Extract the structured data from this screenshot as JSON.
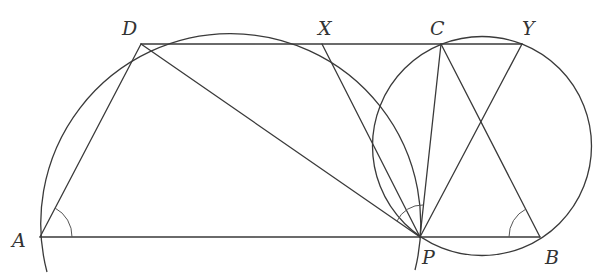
{
  "diagram": {
    "stroke_color": "#3a3a3a",
    "points": {
      "A": {
        "label": "A",
        "x": 40,
        "y": 237
      },
      "B": {
        "label": "B",
        "x": 540,
        "y": 237
      },
      "C": {
        "label": "C",
        "x": 441,
        "y": 44
      },
      "D": {
        "label": "D",
        "x": 141,
        "y": 44
      },
      "P": {
        "label": "P",
        "x": 420,
        "y": 237
      },
      "X": {
        "label": "X",
        "x": 322,
        "y": 44
      },
      "Y": {
        "label": "Y",
        "x": 522,
        "y": 44
      }
    },
    "segments": [
      "DY",
      "AB",
      "AD",
      "DP",
      "XP",
      "CP",
      "YP",
      "CB"
    ],
    "circles": [
      {
        "name": "circle-DXP",
        "cx": 231.5,
        "cy": 211,
        "r": 190,
        "drawn_as": "arc"
      },
      {
        "name": "circle-CYPB",
        "cx": 482,
        "cy": 146,
        "r": 109,
        "drawn_as": "full"
      }
    ],
    "angle_marks": [
      "angle-A (DAB)",
      "angle-P (DPX / DPC)",
      "angle-B (CBA)"
    ]
  }
}
